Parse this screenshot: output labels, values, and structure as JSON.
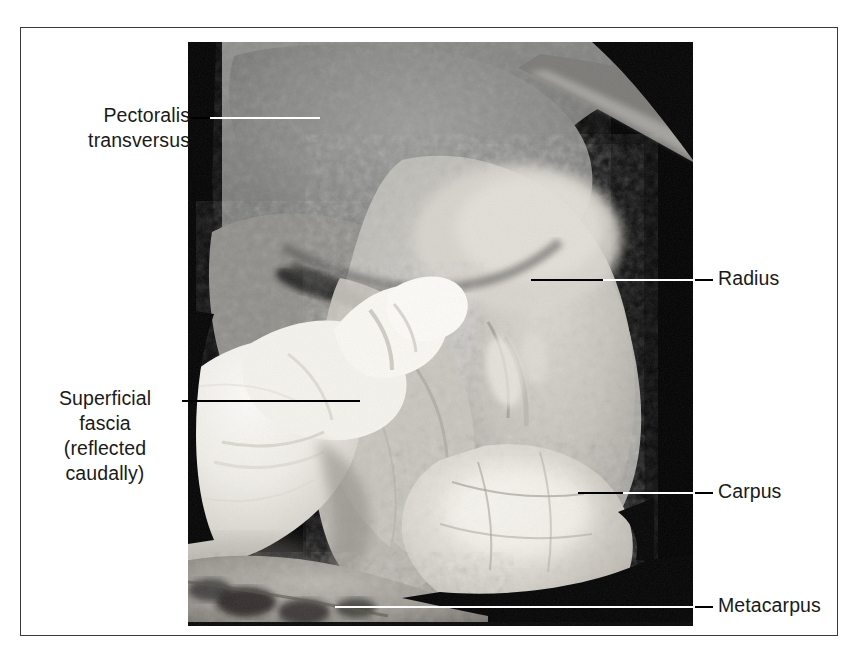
{
  "figure": {
    "type": "anatomical-photograph",
    "background_color": "#ffffff",
    "frame_color": "#3a3a3a",
    "photo_matte_color": "#000000",
    "leader_line_color_on_white": "#000000",
    "leader_line_color_on_black": "#ffffff"
  },
  "labels": {
    "left": [
      {
        "id": "pectoralis-transversus",
        "text": "Pectoralis\ntransversus",
        "align": "right",
        "leader_y": 118
      },
      {
        "id": "superficial-fascia",
        "text": "Superficial\nfascia\n(reflected\ncaudally)",
        "align": "center",
        "leader_y": 401
      }
    ],
    "right": [
      {
        "id": "radius",
        "text": "Radius",
        "align": "left",
        "leader_y": 280
      },
      {
        "id": "carpus",
        "text": "Carpus",
        "align": "left",
        "leader_y": 493
      },
      {
        "id": "metacarpus",
        "text": "Metacarpus",
        "align": "left",
        "leader_y": 607
      }
    ]
  }
}
